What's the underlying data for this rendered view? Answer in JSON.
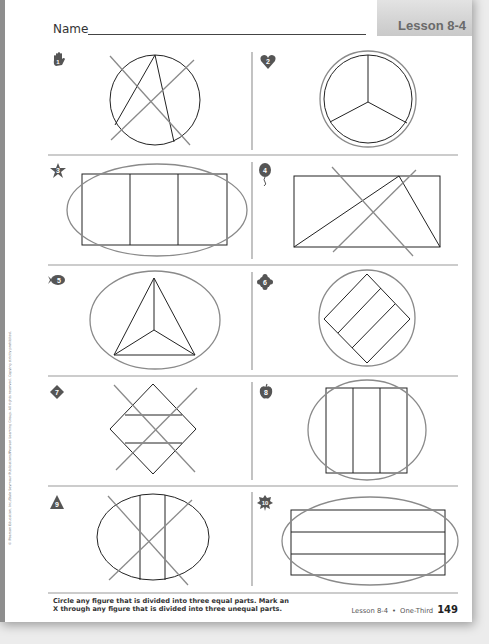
{
  "header": {
    "name_label": "Name",
    "lesson_badge": "Lesson 8-4"
  },
  "copyright": "© Pearson Education, Inc./Dale Seymour Publications/Pearson Learning Group. All rights reserved. Copying strictly prohibited.",
  "problems": [
    {
      "number": "1",
      "icon": "hand-icon",
      "figure": "circle divided into 3 unequal parts",
      "mark": "X"
    },
    {
      "number": "2",
      "icon": "heart-icon",
      "figure": "circle divided into 3 equal parts",
      "mark": "circle"
    },
    {
      "number": "3",
      "icon": "star-icon",
      "figure": "rectangle divided into 3 equal vertical parts",
      "mark": "circle"
    },
    {
      "number": "4",
      "icon": "balloon-icon",
      "figure": "rectangle divided into 3 unequal triangles",
      "mark": "X"
    },
    {
      "number": "5",
      "icon": "fish-icon",
      "figure": "triangle divided into 3 equal parts",
      "mark": "circle"
    },
    {
      "number": "6",
      "icon": "flower-icon",
      "figure": "square divided into 3 equal strips",
      "mark": "circle"
    },
    {
      "number": "7",
      "icon": "diamond-icon",
      "figure": "diamond divided into 3 unequal parts",
      "mark": "X"
    },
    {
      "number": "8",
      "icon": "apple-icon",
      "figure": "square divided into 3 equal vertical parts",
      "mark": "circle"
    },
    {
      "number": "9",
      "icon": "triangle-icon",
      "figure": "oval divided into 3 unequal parts",
      "mark": "X"
    },
    {
      "number": "10",
      "icon": "leaf-icon",
      "figure": "rectangle divided into 3 equal horizontal strips",
      "mark": "circle"
    }
  ],
  "footer": {
    "instructions_line1": "Circle any figure that is divided into three equal parts. Mark an",
    "instructions_line2": "X through any figure that is divided into three unequal parts.",
    "lesson_ref": "Lesson 8-4",
    "bullet": "•",
    "topic": "One-Third",
    "page_number": "149"
  },
  "colors": {
    "figure_stroke": "#222222",
    "mark_stroke": "#8a8a8a",
    "badge_fill": "#555555",
    "badge_text": "#ffffff"
  }
}
